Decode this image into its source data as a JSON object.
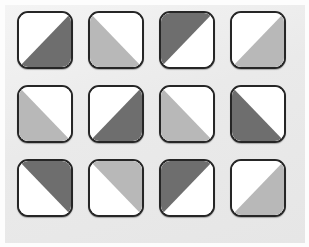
{
  "panel": {
    "name": "triangle-tile-grid",
    "rows": 3,
    "columns": 4,
    "tile_count": 12,
    "background_color": "#ececec",
    "page_background_color": "#fdfdfd"
  },
  "palette": {
    "dark": "#6e6e6e",
    "light": "#b8b8b8",
    "empty": "#ffffff",
    "border": "#262626"
  },
  "tiles": [
    {
      "id": "tile-r1c1",
      "row": 1,
      "col": 1,
      "shade": "dark",
      "shade_color": "#6e6e6e",
      "filled_half": "bottom-right",
      "diagonal": "anti",
      "label": "dark bottom-right"
    },
    {
      "id": "tile-r1c2",
      "row": 1,
      "col": 2,
      "shade": "light",
      "shade_color": "#b8b8b8",
      "filled_half": "bottom-left",
      "diagonal": "main",
      "label": "light bottom-left"
    },
    {
      "id": "tile-r1c3",
      "row": 1,
      "col": 3,
      "shade": "dark",
      "shade_color": "#6e6e6e",
      "filled_half": "top-left",
      "diagonal": "anti",
      "label": "dark top-left"
    },
    {
      "id": "tile-r1c4",
      "row": 1,
      "col": 4,
      "shade": "light",
      "shade_color": "#b8b8b8",
      "filled_half": "bottom-right",
      "diagonal": "main",
      "label": "light bottom-right"
    },
    {
      "id": "tile-r2c1",
      "row": 2,
      "col": 1,
      "shade": "light",
      "shade_color": "#b8b8b8",
      "filled_half": "bottom-left",
      "diagonal": "main",
      "label": "light bottom-left"
    },
    {
      "id": "tile-r2c2",
      "row": 2,
      "col": 2,
      "shade": "dark",
      "shade_color": "#6e6e6e",
      "filled_half": "bottom-right",
      "diagonal": "anti",
      "label": "dark bottom-right"
    },
    {
      "id": "tile-r2c3",
      "row": 2,
      "col": 3,
      "shade": "light",
      "shade_color": "#b8b8b8",
      "filled_half": "bottom-left",
      "diagonal": "main",
      "label": "light bottom-left"
    },
    {
      "id": "tile-r2c4",
      "row": 2,
      "col": 4,
      "shade": "dark",
      "shade_color": "#6e6e6e",
      "filled_half": "bottom-left",
      "diagonal": "main",
      "label": "dark bottom-left"
    },
    {
      "id": "tile-r3c1",
      "row": 3,
      "col": 1,
      "shade": "dark",
      "shade_color": "#6e6e6e",
      "filled_half": "top-right",
      "diagonal": "main",
      "label": "dark top-right"
    },
    {
      "id": "tile-r3c2",
      "row": 3,
      "col": 2,
      "shade": "light",
      "shade_color": "#b8b8b8",
      "filled_half": "top-right",
      "diagonal": "main",
      "label": "light top-right"
    },
    {
      "id": "tile-r3c3",
      "row": 3,
      "col": 3,
      "shade": "dark",
      "shade_color": "#6e6e6e",
      "filled_half": "top-left",
      "diagonal": "anti",
      "label": "dark top-left"
    },
    {
      "id": "tile-r3c4",
      "row": 3,
      "col": 4,
      "shade": "light",
      "shade_color": "#b8b8b8",
      "filled_half": "bottom-right",
      "diagonal": "main",
      "label": "light bottom-right"
    }
  ]
}
